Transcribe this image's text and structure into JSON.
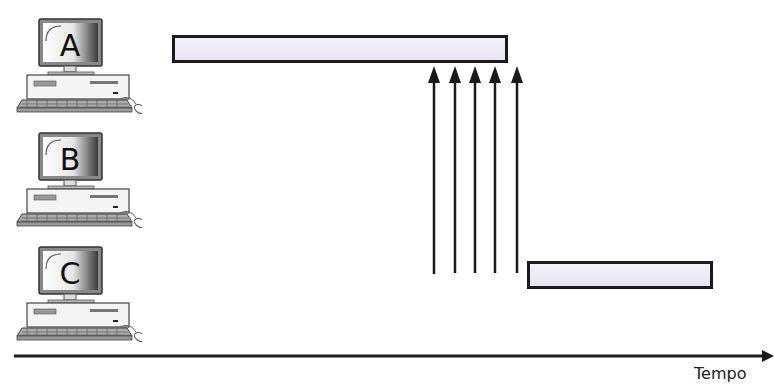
{
  "computers": [
    {
      "id": "A",
      "label": "A",
      "top": 8
    },
    {
      "id": "B",
      "label": "B",
      "top": 122
    },
    {
      "id": "C",
      "label": "C",
      "top": 236
    }
  ],
  "bars": [
    {
      "name": "computer-a-activity-bar",
      "left": 172,
      "top": 35,
      "width": 336,
      "height": 28
    },
    {
      "name": "computer-c-activity-bar",
      "left": 527,
      "top": 261,
      "width": 186,
      "height": 28
    }
  ],
  "signal_arrows": {
    "count": 5,
    "x": [
      434,
      455,
      475,
      496,
      517
    ],
    "y_top": 66,
    "y_bottom": 273,
    "direction": "up"
  },
  "time_axis": {
    "label": "Tempo",
    "y": 356,
    "x_start": 14,
    "x_end": 774
  },
  "colors": {
    "ink": "#1a1a1a",
    "bar_fill": "#efecf8"
  }
}
